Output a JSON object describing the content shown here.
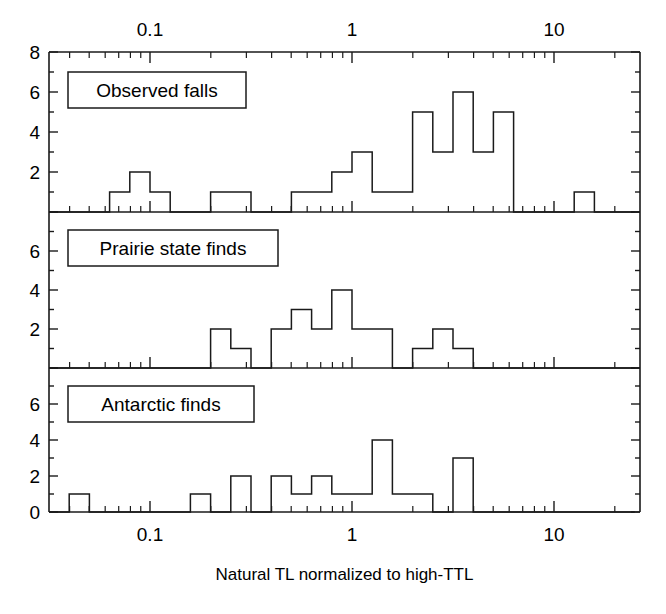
{
  "figure": {
    "xlabel": "Natural TL normalized to high-TTL",
    "x_tick_labels_top": [
      "0.1",
      "1",
      "10"
    ],
    "x_tick_labels_bottom": [
      "0.1",
      "1",
      "10"
    ],
    "panel_labels": [
      "Observed falls",
      "Prairie state finds",
      "Antarctic finds"
    ],
    "y_tick_labels_top_panel": [
      "8",
      "6",
      "4",
      "2"
    ],
    "y_tick_labels_middle_panel": [
      "6",
      "4",
      "2"
    ],
    "y_tick_labels_bottom_panel": [
      "6",
      "4",
      "2",
      "0"
    ],
    "line_color": "#1a1a1a",
    "background_color": "#ffffff"
  },
  "chart_data": [
    {
      "type": "bar",
      "title": "Observed falls",
      "xlabel": "Natural TL normalized to high-TTL",
      "ylabel": "",
      "xscale": "log",
      "xlim": [
        0.0316,
        25.0
      ],
      "ylim": [
        0,
        8
      ],
      "yticks": [
        0,
        2,
        4,
        6,
        8
      ],
      "ytick_labels": [
        "",
        "2",
        "4",
        "6",
        "8"
      ],
      "grid": false,
      "legend": "none",
      "bin_edges_log10": [
        -1.5,
        -1.4,
        -1.3,
        -1.2,
        -1.1,
        -1.0,
        -0.9,
        -0.8,
        -0.7,
        -0.6,
        -0.5,
        -0.4,
        -0.3,
        -0.2,
        -0.1,
        0.0,
        0.1,
        0.2,
        0.3,
        0.4,
        0.5,
        0.6,
        0.7,
        0.8,
        0.9,
        1.0,
        1.1,
        1.2,
        1.3,
        1.4
      ],
      "bin_centers": [
        0.0355,
        0.0447,
        0.0562,
        0.0708,
        0.0891,
        0.1122,
        0.1413,
        0.1778,
        0.2239,
        0.2818,
        0.3548,
        0.4467,
        0.5623,
        0.7079,
        0.8913,
        1.122,
        1.413,
        1.778,
        2.239,
        2.818,
        3.548,
        4.467,
        5.623,
        7.079,
        8.913,
        11.22,
        14.13,
        17.78,
        22.39
      ],
      "values": [
        0,
        0,
        0,
        1,
        2,
        1,
        0,
        0,
        1,
        1,
        0,
        0,
        1,
        1,
        2,
        3,
        1,
        1,
        5,
        3,
        6,
        3,
        5,
        0,
        0,
        0,
        1,
        0,
        0
      ]
    },
    {
      "type": "bar",
      "title": "Prairie state finds",
      "xlabel": "Natural TL normalized to high-TTL",
      "ylabel": "",
      "xscale": "log",
      "xlim": [
        0.0316,
        25.0
      ],
      "ylim": [
        0,
        8
      ],
      "yticks": [
        0,
        2,
        4,
        6,
        8
      ],
      "ytick_labels": [
        "",
        "2",
        "4",
        "6",
        ""
      ],
      "grid": false,
      "legend": "none",
      "bin_edges_log10": [
        -1.5,
        -1.4,
        -1.3,
        -1.2,
        -1.1,
        -1.0,
        -0.9,
        -0.8,
        -0.7,
        -0.6,
        -0.5,
        -0.4,
        -0.3,
        -0.2,
        -0.1,
        0.0,
        0.1,
        0.2,
        0.3,
        0.4,
        0.5,
        0.6,
        0.7,
        0.8,
        0.9,
        1.0,
        1.1,
        1.2,
        1.3,
        1.4
      ],
      "bin_centers": [
        0.0355,
        0.0447,
        0.0562,
        0.0708,
        0.0891,
        0.1122,
        0.1413,
        0.1778,
        0.2239,
        0.2818,
        0.3548,
        0.4467,
        0.5623,
        0.7079,
        0.8913,
        1.122,
        1.413,
        1.778,
        2.239,
        2.818,
        3.548,
        4.467,
        5.623,
        7.079,
        8.913,
        11.22,
        14.13,
        17.78,
        22.39
      ],
      "values": [
        0,
        0,
        0,
        0,
        0,
        0,
        0,
        0,
        2,
        1,
        0,
        2,
        3,
        2,
        4,
        2,
        2,
        0,
        1,
        2,
        1,
        0,
        0,
        0,
        0,
        0,
        0,
        0,
        0
      ]
    },
    {
      "type": "bar",
      "title": "Antarctic finds",
      "xlabel": "Natural TL normalized to high-TTL",
      "ylabel": "",
      "xscale": "log",
      "xlim": [
        0.0316,
        25.0
      ],
      "ylim": [
        0,
        8
      ],
      "yticks": [
        0,
        2,
        4,
        6,
        8
      ],
      "ytick_labels": [
        "0",
        "2",
        "4",
        "6",
        ""
      ],
      "grid": false,
      "legend": "none",
      "bin_edges_log10": [
        -1.5,
        -1.4,
        -1.3,
        -1.2,
        -1.1,
        -1.0,
        -0.9,
        -0.8,
        -0.7,
        -0.6,
        -0.5,
        -0.4,
        -0.3,
        -0.2,
        -0.1,
        0.0,
        0.1,
        0.2,
        0.3,
        0.4,
        0.5,
        0.6,
        0.7,
        0.8,
        0.9,
        1.0,
        1.1,
        1.2,
        1.3,
        1.4
      ],
      "bin_centers": [
        0.0355,
        0.0447,
        0.0562,
        0.0708,
        0.0891,
        0.1122,
        0.1413,
        0.1778,
        0.2239,
        0.2818,
        0.3548,
        0.4467,
        0.5623,
        0.7079,
        0.8913,
        1.122,
        1.413,
        1.778,
        2.239,
        2.818,
        3.548,
        4.467,
        5.623,
        7.079,
        8.913,
        11.22,
        14.13,
        17.78,
        22.39
      ],
      "values": [
        0,
        1,
        0,
        0,
        0,
        0,
        0,
        1,
        0,
        2,
        0,
        2,
        1,
        2,
        1,
        1,
        4,
        1,
        1,
        0,
        3,
        0,
        0,
        0,
        0,
        0,
        0,
        0,
        0
      ]
    }
  ]
}
